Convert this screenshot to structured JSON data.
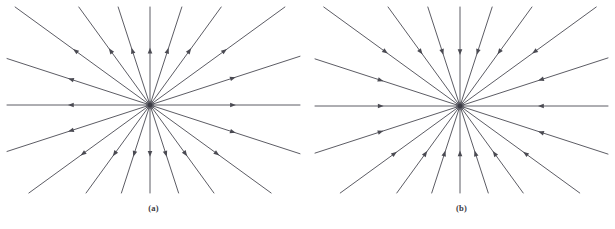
{
  "figure": {
    "background_color": "#ffffff",
    "width": 615,
    "height": 229,
    "line_color": "#4a4a52",
    "hub_color": "#3b3b44",
    "caption_color": "#3a3a42"
  },
  "panels": [
    {
      "id": "a",
      "caption": "(a)",
      "flow_direction": "outward",
      "node_type": "unstable node (source)",
      "center": {
        "x": 150,
        "y": 105
      },
      "ray_count": 20,
      "ray_angle_step_deg": 18,
      "ray_start_angle_deg": 0,
      "arrow_position_fraction": 0.55
    },
    {
      "id": "b",
      "caption": "(b)",
      "flow_direction": "inward",
      "node_type": "stable node (sink)",
      "center": {
        "x": 152,
        "y": 106
      },
      "ray_count": 20,
      "ray_angle_step_deg": 18,
      "ray_start_angle_deg": 0,
      "arrow_position_fraction": 0.55
    }
  ],
  "chart_data": {
    "type": "scatter",
    "title": "",
    "subtitle": "",
    "xlabel": "",
    "ylabel": "",
    "grid": false,
    "legend": null,
    "annotations": [
      "(a)",
      "(b)"
    ],
    "series": [
      {
        "name": "(a) source - trajectories directed away from origin",
        "panel": "a",
        "flow": "outward",
        "origin": [
          0,
          0
        ],
        "ray_angles_deg": [
          0,
          18,
          36,
          54,
          72,
          90,
          108,
          126,
          144,
          162,
          180,
          198,
          216,
          234,
          252,
          270,
          288,
          306,
          324,
          342
        ],
        "arrow_direction_sign": 1
      },
      {
        "name": "(b) sink - trajectories directed toward origin",
        "panel": "b",
        "flow": "inward",
        "origin": [
          0,
          0
        ],
        "ray_angles_deg": [
          0,
          18,
          36,
          54,
          72,
          90,
          108,
          126,
          144,
          162,
          180,
          198,
          216,
          234,
          252,
          270,
          288,
          306,
          324,
          342
        ],
        "arrow_direction_sign": -1
      }
    ],
    "xlim": [
      -1,
      1
    ],
    "ylim": [
      -1,
      1
    ]
  }
}
